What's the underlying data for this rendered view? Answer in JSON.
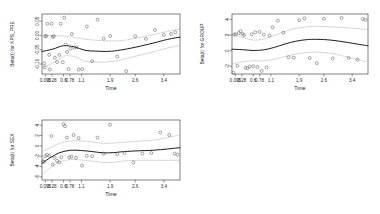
{
  "figure": {
    "type": "multi-panel-scatter",
    "panel_count": 3,
    "background_color": "#ffffff",
    "point_color": "#5d5d5d",
    "fit_color": "#1c1c1c",
    "ci_color": "#b9b9b9"
  },
  "chart_data": [
    {
      "id": "panel-kps-pre",
      "type": "scatter",
      "title": "",
      "xlabel": "Time",
      "ylabel": "Beta(t) for KPS_PRE",
      "xticklabels": [
        "0.095",
        "0.28",
        "0.6",
        "0.78",
        "1.1",
        "1.9",
        "2.6",
        "3.4"
      ],
      "xtickpos": [
        0.095,
        0.28,
        0.6,
        0.78,
        1.1,
        1.9,
        2.6,
        3.4
      ],
      "yticklabels": [
        "0.05",
        "0.00",
        "-0.05",
        "-0.10"
      ],
      "ytickvals": [
        0.05,
        0.0,
        -0.05,
        -0.1
      ],
      "xlim": [
        0.0,
        3.85
      ],
      "ylim": [
        -0.135,
        0.075
      ],
      "grid": false,
      "legend": "none",
      "x": [
        0.06,
        0.08,
        0.09,
        0.12,
        0.15,
        0.2,
        0.22,
        0.27,
        0.3,
        0.33,
        0.36,
        0.42,
        0.48,
        0.52,
        0.58,
        0.62,
        0.66,
        0.7,
        0.74,
        0.79,
        0.83,
        0.9,
        0.96,
        1.02,
        1.12,
        1.25,
        1.4,
        1.55,
        1.72,
        1.9,
        2.1,
        2.35,
        2.6,
        2.9,
        3.15,
        3.4,
        3.6,
        3.72
      ],
      "y": [
        -0.098,
        -0.112,
        -0.003,
        -0.002,
        0.041,
        -0.068,
        -0.119,
        0.041,
        -0.005,
        -0.003,
        -0.078,
        -0.093,
        -0.068,
        0.041,
        -0.094,
        0.062,
        -0.032,
        -0.058,
        -0.118,
        -0.046,
        0.005,
        -0.043,
        -0.041,
        -0.12,
        -0.118,
        0.031,
        -0.09,
        0.055,
        -0.011,
        -0.002,
        -0.074,
        -0.125,
        -0.003,
        -0.012,
        0.019,
        0.002,
        0.005,
        0.011
      ],
      "fit_curve": {
        "x": [
          0.0,
          0.3,
          0.6,
          0.9,
          1.2,
          1.5,
          1.8,
          2.1,
          2.5,
          3.0,
          3.5,
          3.85
        ],
        "y": [
          -0.056,
          -0.048,
          -0.036,
          -0.04,
          -0.052,
          -0.055,
          -0.056,
          -0.053,
          -0.044,
          -0.03,
          -0.014,
          -0.006
        ]
      },
      "ci_upper": {
        "x": [
          0.0,
          0.3,
          0.6,
          0.9,
          1.2,
          1.5,
          1.8,
          2.1,
          2.5,
          3.0,
          3.5,
          3.85
        ],
        "y": [
          0.001,
          -0.001,
          -0.002,
          -0.007,
          -0.013,
          -0.017,
          -0.019,
          -0.019,
          -0.013,
          0.0,
          0.014,
          0.022
        ]
      },
      "ci_lower": {
        "x": [
          0.0,
          0.3,
          0.6,
          0.9,
          1.2,
          1.5,
          1.8,
          2.1,
          2.5,
          3.0,
          3.5,
          3.85
        ],
        "y": [
          -0.112,
          -0.097,
          -0.073,
          -0.074,
          -0.09,
          -0.093,
          -0.093,
          -0.088,
          -0.076,
          -0.061,
          -0.044,
          -0.035
        ]
      }
    },
    {
      "id": "panel-group",
      "type": "scatter",
      "title": "",
      "xlabel": "Time",
      "ylabel": "Beta(t) for GROUP",
      "xticklabels": [
        "0.095",
        "0.28",
        "0.6",
        "0.78",
        "1.1",
        "1.9",
        "2.6",
        "3.4"
      ],
      "xtickpos": [
        0.095,
        0.28,
        0.6,
        0.78,
        1.1,
        1.9,
        2.6,
        3.4
      ],
      "yticklabels": [
        "4",
        "2",
        "0",
        "-2"
      ],
      "ytickvals": [
        4,
        2,
        0,
        -2
      ],
      "xlim": [
        0.0,
        3.85
      ],
      "ylim": [
        -3.0,
        4.7
      ],
      "grid": false,
      "legend": "none",
      "x": [
        0.04,
        0.06,
        0.1,
        0.15,
        0.19,
        0.24,
        0.3,
        0.34,
        0.38,
        0.44,
        0.5,
        0.56,
        0.6,
        0.66,
        0.72,
        0.78,
        0.84,
        0.9,
        0.98,
        1.06,
        1.15,
        1.3,
        1.45,
        1.6,
        1.75,
        1.9,
        2.05,
        2.2,
        2.4,
        2.6,
        2.85,
        3.1,
        3.3,
        3.55,
        3.7,
        3.78
      ],
      "y": [
        -2.85,
        2.05,
        2.1,
        -1.95,
        2.25,
        2.5,
        2.15,
        2.0,
        -2.2,
        -2.25,
        -2.05,
        2.1,
        -2.0,
        2.35,
        -2.1,
        2.4,
        -2.6,
        2.05,
        -2.15,
        1.95,
        3.0,
        3.85,
        2.3,
        -0.85,
        -0.9,
        3.9,
        4.15,
        -0.95,
        -1.6,
        4.1,
        -1.0,
        4.2,
        -0.95,
        -1.15,
        4.05,
        3.95
      ],
      "fit_curve": {
        "x": [
          0.0,
          0.3,
          0.6,
          0.9,
          1.2,
          1.5,
          1.8,
          2.1,
          2.4,
          2.8,
          3.2,
          3.6,
          3.85
        ],
        "y": [
          0.18,
          0.12,
          0.02,
          0.1,
          0.42,
          0.85,
          1.2,
          1.4,
          1.45,
          1.35,
          1.1,
          0.8,
          0.62
        ]
      },
      "ci_upper": {
        "x": [
          0.0,
          0.3,
          0.6,
          0.9,
          1.2,
          1.5,
          1.8,
          2.1,
          2.4,
          2.8,
          3.2,
          3.6,
          3.85
        ],
        "y": [
          2.1,
          1.7,
          1.35,
          1.5,
          1.95,
          2.45,
          2.85,
          3.05,
          3.1,
          3.05,
          2.95,
          2.8,
          2.7
        ]
      },
      "ci_lower": {
        "x": [
          0.0,
          0.3,
          0.6,
          0.9,
          1.2,
          1.5,
          1.8,
          2.1,
          2.4,
          2.8,
          3.2,
          3.6,
          3.85
        ],
        "y": [
          -1.7,
          -1.45,
          -1.3,
          -1.3,
          -1.1,
          -0.75,
          -0.45,
          -0.25,
          -0.2,
          -0.35,
          -0.75,
          -1.2,
          -1.45
        ]
      }
    },
    {
      "id": "panel-sex",
      "type": "scatter",
      "title": "",
      "xlabel": "Time",
      "ylabel": "Beta(t) for SEX",
      "xticklabels": [
        "0.095",
        "0.28",
        "0.6",
        "0.78",
        "1.1",
        "1.9",
        "2.6",
        "3.4"
      ],
      "xtickpos": [
        0.095,
        0.28,
        0.6,
        0.78,
        1.1,
        1.9,
        2.6,
        3.4
      ],
      "yticklabels": [
        "4",
        "2",
        "0",
        "-2",
        "-4",
        "-6"
      ],
      "ytickvals": [
        4,
        2,
        0,
        -2,
        -4,
        -6
      ],
      "xlim": [
        0.0,
        3.85
      ],
      "ylim": [
        -6.6,
        5.0
      ],
      "grid": false,
      "legend": "none",
      "x": [
        0.03,
        0.05,
        0.09,
        0.14,
        0.2,
        0.26,
        0.3,
        0.35,
        0.42,
        0.48,
        0.54,
        0.6,
        0.64,
        0.7,
        0.76,
        0.82,
        0.88,
        0.95,
        1.02,
        1.12,
        1.25,
        1.4,
        1.55,
        1.72,
        1.9,
        2.1,
        2.3,
        2.55,
        2.8,
        3.05,
        3.3,
        3.55,
        3.7,
        3.78
      ],
      "y": [
        -3.0,
        -3.1,
        -2.0,
        -1.7,
        -1.9,
        1.9,
        -3.6,
        -2.3,
        -2.9,
        -3.2,
        -2.2,
        4.2,
        3.8,
        1.6,
        -2.2,
        -2.1,
        2.1,
        -2.3,
        1.5,
        -3.8,
        -1.9,
        -2.0,
        1.6,
        -1.5,
        4.1,
        -1.6,
        -1.4,
        -3.2,
        -1.5,
        -1.4,
        2.6,
        2.1,
        -1.5,
        -1.7
      ],
      "fit_curve": {
        "x": [
          0.0,
          0.25,
          0.5,
          0.8,
          1.1,
          1.4,
          1.7,
          2.0,
          2.3,
          2.7,
          3.1,
          3.5,
          3.85
        ],
        "y": [
          -3.35,
          -2.2,
          -1.3,
          -0.85,
          -0.9,
          -1.1,
          -1.35,
          -1.3,
          -1.1,
          -0.95,
          -0.85,
          -0.6,
          -0.35
        ]
      },
      "ci_upper": {
        "x": [
          0.0,
          0.25,
          0.5,
          0.8,
          1.1,
          1.4,
          1.7,
          2.0,
          2.3,
          2.7,
          3.1,
          3.5,
          3.85
        ],
        "y": [
          -1.1,
          -0.3,
          0.5,
          0.95,
          0.95,
          0.75,
          0.5,
          0.55,
          0.7,
          0.9,
          1.1,
          1.6,
          2.1
        ]
      },
      "ci_lower": {
        "x": [
          0.0,
          0.25,
          0.5,
          0.8,
          1.1,
          1.4,
          1.7,
          2.0,
          2.3,
          2.7,
          3.1,
          3.5,
          3.85
        ],
        "y": [
          -5.6,
          -4.1,
          -3.1,
          -2.65,
          -2.75,
          -2.95,
          -3.2,
          -3.15,
          -2.9,
          -2.8,
          -2.8,
          -2.8,
          -2.8
        ]
      }
    }
  ]
}
